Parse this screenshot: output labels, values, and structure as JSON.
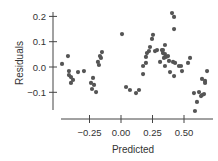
{
  "chart_data": {
    "type": "scatter",
    "title": "",
    "xlabel": "Predicted",
    "ylabel": "Residuals",
    "xlim": [
      -0.47,
      0.73
    ],
    "ylim": [
      -0.17,
      0.22
    ],
    "grid": false,
    "legend": null,
    "x_ticks": [
      -0.25,
      0.0,
      0.25,
      0.5
    ],
    "x_tick_labels": [
      "−0.25",
      "0.00",
      "0.25",
      "0.50"
    ],
    "y_ticks": [
      0.2,
      0.1,
      0.0,
      -0.1
    ],
    "y_tick_labels": [
      "0.2",
      "0.1",
      "0.0",
      "−0.1"
    ],
    "marker_color": "#555555",
    "axis_color": "#444444",
    "points": [
      {
        "x": -0.468,
        "y": 0.012
      },
      {
        "x": -0.421,
        "y": 0.043
      },
      {
        "x": -0.413,
        "y": -0.016
      },
      {
        "x": -0.413,
        "y": -0.032
      },
      {
        "x": -0.397,
        "y": -0.04
      },
      {
        "x": -0.381,
        "y": -0.051
      },
      {
        "x": -0.397,
        "y": -0.063
      },
      {
        "x": -0.341,
        "y": -0.02
      },
      {
        "x": -0.294,
        "y": -0.016
      },
      {
        "x": -0.151,
        "y": 0.059
      },
      {
        "x": -0.167,
        "y": 0.043
      },
      {
        "x": -0.159,
        "y": 0.036
      },
      {
        "x": -0.183,
        "y": 0.02
      },
      {
        "x": -0.175,
        "y": 0.008
      },
      {
        "x": -0.222,
        "y": -0.043
      },
      {
        "x": -0.238,
        "y": -0.063
      },
      {
        "x": -0.214,
        "y": -0.071
      },
      {
        "x": -0.23,
        "y": -0.087
      },
      {
        "x": -0.198,
        "y": -0.099
      },
      {
        "x": 0.008,
        "y": 0.13
      },
      {
        "x": 0.04,
        "y": -0.079
      },
      {
        "x": 0.071,
        "y": -0.091
      },
      {
        "x": 0.119,
        "y": -0.103
      },
      {
        "x": 0.143,
        "y": -0.091
      },
      {
        "x": 0.175,
        "y": -0.028
      },
      {
        "x": 0.175,
        "y": 0.004
      },
      {
        "x": 0.198,
        "y": 0.016
      },
      {
        "x": 0.198,
        "y": 0.04
      },
      {
        "x": 0.206,
        "y": 0.055
      },
      {
        "x": 0.222,
        "y": 0.063
      },
      {
        "x": 0.23,
        "y": 0.079
      },
      {
        "x": 0.254,
        "y": 0.127
      },
      {
        "x": 0.246,
        "y": 0.111
      },
      {
        "x": 0.27,
        "y": 0.063
      },
      {
        "x": 0.286,
        "y": 0.067
      },
      {
        "x": 0.31,
        "y": 0.02
      },
      {
        "x": 0.325,
        "y": 0.067
      },
      {
        "x": 0.333,
        "y": 0.055
      },
      {
        "x": 0.341,
        "y": 0.036
      },
      {
        "x": 0.349,
        "y": 0.051
      },
      {
        "x": 0.357,
        "y": 0.04
      },
      {
        "x": 0.373,
        "y": 0.043
      },
      {
        "x": 0.381,
        "y": 0.024
      },
      {
        "x": 0.349,
        "y": 0.004
      },
      {
        "x": 0.413,
        "y": 0.02
      },
      {
        "x": 0.429,
        "y": 0.016
      },
      {
        "x": 0.389,
        "y": -0.02
      },
      {
        "x": 0.421,
        "y": -0.036
      },
      {
        "x": 0.46,
        "y": 0.004
      },
      {
        "x": 0.476,
        "y": 0.004
      },
      {
        "x": 0.484,
        "y": -0.016
      },
      {
        "x": 0.532,
        "y": 0.016
      },
      {
        "x": 0.548,
        "y": 0.036
      },
      {
        "x": 0.579,
        "y": -0.103
      },
      {
        "x": 0.619,
        "y": -0.099
      },
      {
        "x": 0.635,
        "y": -0.115
      },
      {
        "x": 0.643,
        "y": -0.111
      },
      {
        "x": 0.659,
        "y": -0.107
      },
      {
        "x": 0.667,
        "y": -0.063
      },
      {
        "x": 0.643,
        "y": -0.047
      },
      {
        "x": 0.667,
        "y": -0.055
      },
      {
        "x": 0.683,
        "y": -0.016
      },
      {
        "x": 0.603,
        "y": -0.138
      },
      {
        "x": 0.587,
        "y": -0.174
      },
      {
        "x": 0.405,
        "y": 0.213
      },
      {
        "x": 0.421,
        "y": 0.198
      },
      {
        "x": 0.421,
        "y": 0.15
      },
      {
        "x": 0.349,
        "y": 0.087
      },
      {
        "x": 0.333,
        "y": 0.067
      }
    ]
  }
}
